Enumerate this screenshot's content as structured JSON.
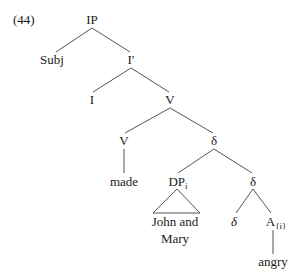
{
  "example_number": "(44)",
  "nodes": {
    "ip": "IP",
    "subj": "Subj",
    "ibar": "I′",
    "i": "I",
    "v_upper": "V",
    "v_lower": "V",
    "delta_upper": "δ",
    "made": "made",
    "dp": "DP",
    "dp_sub": "i",
    "delta_mid": "δ",
    "delta_low": "δ",
    "a": "A",
    "a_sub": "{i}",
    "john_and": "John and",
    "mary": "Mary",
    "angry": "angry"
  },
  "colors": {
    "line": "#555555",
    "text": "#1a1a1a"
  }
}
